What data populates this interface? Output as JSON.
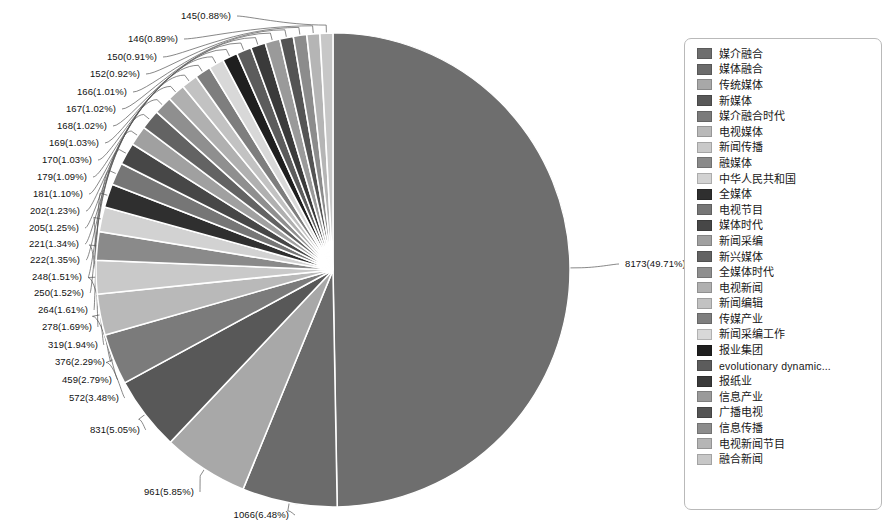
{
  "chart_data": {
    "type": "pie",
    "title": "",
    "subtitle": "",
    "xlabel": "",
    "ylabel": "",
    "legend_position": "right",
    "grid": false,
    "label_format": "count(percent%)",
    "total": 16441,
    "categories": [
      "媒介融合",
      "媒体融合",
      "传统媒体",
      "新媒体",
      "媒介融合时代",
      "电视媒体",
      "新闻传播",
      "融媒体",
      "中华人民共和国",
      "全媒体",
      "电视节目",
      "媒体时代",
      "新闻采编",
      "新兴媒体",
      "全媒体时代",
      "电视新闻",
      "新闻编辑",
      "传媒产业",
      "新闻采编工作",
      "报业集团",
      "evolutionary dynamic...",
      "报纸业",
      "信息产业",
      "广播电视",
      "信息传播",
      "电视新闻节目",
      "融合新闻"
    ],
    "values": [
      8173,
      1066,
      961,
      831,
      572,
      459,
      376,
      319,
      278,
      264,
      250,
      248,
      222,
      221,
      205,
      202,
      181,
      179,
      170,
      169,
      168,
      167,
      166,
      152,
      150,
      146,
      145
    ],
    "percents": [
      49.71,
      6.48,
      5.85,
      5.05,
      3.48,
      2.79,
      2.29,
      1.94,
      1.69,
      1.61,
      1.52,
      1.51,
      1.35,
      1.34,
      1.25,
      1.23,
      1.1,
      1.09,
      1.03,
      1.03,
      1.02,
      1.02,
      1.01,
      0.92,
      0.91,
      0.89,
      0.88
    ],
    "colors": [
      "#6e6e6e",
      "#6b6b6b",
      "#a8a8a8",
      "#585858",
      "#7b7b7b",
      "#b9b9b9",
      "#c9c9c9",
      "#8a8a8a",
      "#d2d2d2",
      "#2f2f2f",
      "#767676",
      "#474747",
      "#a0a0a0",
      "#636363",
      "#8f8f8f",
      "#b0b0b0",
      "#c2c2c2",
      "#7e7e7e",
      "#d8d8d8",
      "#1f1f1f",
      "#5c5c5c",
      "#3a3a3a",
      "#9a9a9a",
      "#545454",
      "#8c8c8c",
      "#b5b5b5",
      "#c7c7c7"
    ],
    "labels": [
      "8173(49.71%)",
      "1066(6.48%)",
      "961(5.85%)",
      "831(5.05%)",
      "572(3.48%)",
      "459(2.79%)",
      "376(2.29%)",
      "319(1.94%)",
      "278(1.69%)",
      "264(1.61%)",
      "250(1.52%)",
      "248(1.51%)",
      "222(1.35%)",
      "221(1.34%)",
      "205(1.25%)",
      "202(1.23%)",
      "181(1.10%)",
      "179(1.09%)",
      "170(1.03%)",
      "169(1.03%)",
      "168(1.02%)",
      "167(1.02%)",
      "166(1.01%)",
      "152(0.92%)",
      "150(0.91%)",
      "146(0.89%)",
      "145(0.88%)"
    ]
  },
  "legend": {
    "items": [
      {
        "label": "媒介融合",
        "color": "#6e6e6e",
        "latin": false
      },
      {
        "label": "媒体融合",
        "color": "#6b6b6b",
        "latin": false
      },
      {
        "label": "传统媒体",
        "color": "#a8a8a8",
        "latin": false
      },
      {
        "label": "新媒体",
        "color": "#585858",
        "latin": false
      },
      {
        "label": "媒介融合时代",
        "color": "#7b7b7b",
        "latin": false
      },
      {
        "label": "电视媒体",
        "color": "#b9b9b9",
        "latin": false
      },
      {
        "label": "新闻传播",
        "color": "#c9c9c9",
        "latin": false
      },
      {
        "label": "融媒体",
        "color": "#8a8a8a",
        "latin": false
      },
      {
        "label": "中华人民共和国",
        "color": "#d2d2d2",
        "latin": false
      },
      {
        "label": "全媒体",
        "color": "#2f2f2f",
        "latin": false
      },
      {
        "label": "电视节目",
        "color": "#767676",
        "latin": false
      },
      {
        "label": "媒体时代",
        "color": "#474747",
        "latin": false
      },
      {
        "label": "新闻采编",
        "color": "#a0a0a0",
        "latin": false
      },
      {
        "label": "新兴媒体",
        "color": "#636363",
        "latin": false
      },
      {
        "label": "全媒体时代",
        "color": "#8f8f8f",
        "latin": false
      },
      {
        "label": "电视新闻",
        "color": "#b0b0b0",
        "latin": false
      },
      {
        "label": "新闻编辑",
        "color": "#c2c2c2",
        "latin": false
      },
      {
        "label": "传媒产业",
        "color": "#7e7e7e",
        "latin": false
      },
      {
        "label": "新闻采编工作",
        "color": "#d8d8d8",
        "latin": false
      },
      {
        "label": "报业集团",
        "color": "#1f1f1f",
        "latin": false
      },
      {
        "label": "evolutionary dynamic...",
        "color": "#5c5c5c",
        "latin": true
      },
      {
        "label": "报纸业",
        "color": "#3a3a3a",
        "latin": false
      },
      {
        "label": "信息产业",
        "color": "#9a9a9a",
        "latin": false
      },
      {
        "label": "广播电视",
        "color": "#545454",
        "latin": false
      },
      {
        "label": "信息传播",
        "color": "#8c8c8c",
        "latin": false
      },
      {
        "label": "电视新闻节目",
        "color": "#b5b5b5",
        "latin": false
      },
      {
        "label": "融合新闻",
        "color": "#c7c7c7",
        "latin": false
      }
    ]
  },
  "pie_geometry": {
    "cx": 333,
    "cy": 270,
    "r": 237,
    "start_angle_deg": -90,
    "direction": "clockwise"
  },
  "label_positions": [
    {
      "i": 0,
      "x": 625,
      "y": 264,
      "align": "left"
    },
    {
      "i": 1,
      "x": 289,
      "y": 515,
      "align": "right"
    },
    {
      "i": 2,
      "x": 194,
      "y": 492,
      "align": "right"
    },
    {
      "i": 3,
      "x": 140,
      "y": 430,
      "align": "right"
    },
    {
      "i": 4,
      "x": 119,
      "y": 398,
      "align": "right"
    },
    {
      "i": 5,
      "x": 112,
      "y": 380,
      "align": "right"
    },
    {
      "i": 6,
      "x": 105,
      "y": 362,
      "align": "right"
    },
    {
      "i": 7,
      "x": 98,
      "y": 345,
      "align": "right"
    },
    {
      "i": 8,
      "x": 92,
      "y": 327,
      "align": "right"
    },
    {
      "i": 9,
      "x": 88,
      "y": 310,
      "align": "right"
    },
    {
      "i": 10,
      "x": 84,
      "y": 293,
      "align": "right"
    },
    {
      "i": 11,
      "x": 82,
      "y": 277,
      "align": "right"
    },
    {
      "i": 12,
      "x": 80,
      "y": 260,
      "align": "right"
    },
    {
      "i": 13,
      "x": 79,
      "y": 244,
      "align": "right"
    },
    {
      "i": 14,
      "x": 79,
      "y": 228,
      "align": "right"
    },
    {
      "i": 15,
      "x": 80,
      "y": 211,
      "align": "right"
    },
    {
      "i": 16,
      "x": 83,
      "y": 194,
      "align": "right"
    },
    {
      "i": 17,
      "x": 87,
      "y": 177,
      "align": "right"
    },
    {
      "i": 18,
      "x": 92,
      "y": 160,
      "align": "right"
    },
    {
      "i": 19,
      "x": 99,
      "y": 143,
      "align": "right"
    },
    {
      "i": 20,
      "x": 107,
      "y": 126,
      "align": "right"
    },
    {
      "i": 21,
      "x": 116,
      "y": 109,
      "align": "right"
    },
    {
      "i": 22,
      "x": 127,
      "y": 92,
      "align": "right"
    },
    {
      "i": 23,
      "x": 140,
      "y": 74,
      "align": "right"
    },
    {
      "i": 24,
      "x": 157,
      "y": 57,
      "align": "right"
    },
    {
      "i": 25,
      "x": 178,
      "y": 39,
      "align": "right"
    },
    {
      "i": 26,
      "x": 231,
      "y": 16,
      "align": "right"
    }
  ]
}
